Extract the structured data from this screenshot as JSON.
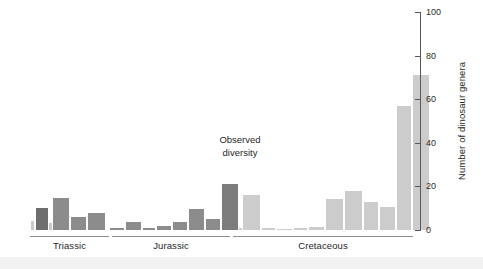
{
  "chart_data": {
    "type": "bar",
    "title": "",
    "subtitle": "",
    "xlabel": "",
    "ylabel": "Number of dinosaur genera",
    "ylim": [
      0,
      100
    ],
    "yticks": [
      0,
      20,
      40,
      60,
      80,
      100
    ],
    "ytick_labels": [
      "0",
      "20",
      "40",
      "60",
      "80",
      "100"
    ],
    "grid": false,
    "legend": false,
    "annotations": [
      {
        "text_line1": "Observed",
        "text_line2": "diversity",
        "x_px": 240,
        "y_px": 133
      }
    ],
    "x_axis_groups": [
      {
        "label": "Triassic",
        "start_px": 30,
        "end_px": 109
      },
      {
        "label": "Jurassic",
        "start_px": 112,
        "end_px": 230
      },
      {
        "label": "Cretaceous",
        "start_px": 233,
        "end_px": 413
      }
    ],
    "colors": {
      "triassic_dark": "#6e6e6e",
      "triassic_mid": "#8a8a8a",
      "jurassic": "#8a8a8a",
      "jurassic_dark": "#7a7a7a",
      "cretaceous": "#c8c8c8",
      "cretaceous_light": "#d2d2d2",
      "axis": "#585858",
      "text": "#1f1f1f",
      "background": "#ffffff"
    },
    "categories": [
      "T1",
      "T2",
      "T3",
      "T4",
      "T5",
      "T6",
      "J1",
      "J2",
      "J3",
      "J4",
      "J5",
      "J6",
      "J7",
      "J8",
      "J9",
      "J10",
      "K1",
      "K2",
      "K3",
      "K4",
      "K5",
      "K6",
      "K7",
      "K8",
      "K9",
      "K10",
      "K11"
    ],
    "values": [
      4,
      10,
      3,
      14.5,
      6,
      8,
      1,
      3.5,
      1,
      2,
      3.5,
      9.5,
      5,
      21,
      1,
      16,
      1,
      0.3,
      1,
      1.5,
      14,
      18,
      13,
      10.5,
      57,
      71,
      0
    ],
    "bars": [
      {
        "name": "T1",
        "x_px": 30.5,
        "w_px": 3,
        "value": 4,
        "color": "#c9c9c9"
      },
      {
        "name": "T2",
        "x_px": 36,
        "w_px": 12,
        "value": 10,
        "color": "#6e6e6e"
      },
      {
        "name": "T3",
        "x_px": 49,
        "w_px": 3,
        "value": 3,
        "color": "#c9c9c9"
      },
      {
        "name": "T4",
        "x_px": 53,
        "w_px": 16,
        "value": 14.5,
        "color": "#8c8c8c"
      },
      {
        "name": "T5",
        "x_px": 71,
        "w_px": 15,
        "value": 6,
        "color": "#8c8c8c"
      },
      {
        "name": "T6",
        "x_px": 88,
        "w_px": 17,
        "value": 8,
        "color": "#8c8c8c"
      },
      {
        "name": "J1",
        "x_px": 110,
        "w_px": 14,
        "value": 1,
        "color": "#8c8c8c"
      },
      {
        "name": "J2",
        "x_px": 126,
        "w_px": 15,
        "value": 3.5,
        "color": "#8c8c8c"
      },
      {
        "name": "J3",
        "x_px": 143,
        "w_px": 12,
        "value": 1,
        "color": "#8c8c8c"
      },
      {
        "name": "J4",
        "x_px": 157,
        "w_px": 14,
        "value": 2,
        "color": "#8c8c8c"
      },
      {
        "name": "J5",
        "x_px": 173,
        "w_px": 14,
        "value": 3.5,
        "color": "#8c8c8c"
      },
      {
        "name": "J6",
        "x_px": 189,
        "w_px": 15,
        "value": 9.5,
        "color": "#8c8c8c"
      },
      {
        "name": "J7",
        "x_px": 206,
        "w_px": 14,
        "value": 5,
        "color": "#8c8c8c"
      },
      {
        "name": "J8",
        "x_px": 222,
        "w_px": 16,
        "value": 21,
        "color": "#7d7d7d"
      },
      {
        "name": "J9",
        "x_px": 239,
        "w_px": 3,
        "value": 1,
        "color": "#c9c9c9"
      },
      {
        "name": "J10",
        "x_px": 243,
        "w_px": 17,
        "value": 16,
        "color": "#cccccc"
      },
      {
        "name": "K1",
        "x_px": 262,
        "w_px": 13,
        "value": 1,
        "color": "#cccccc"
      },
      {
        "name": "K2",
        "x_px": 277,
        "w_px": 15,
        "value": 0.3,
        "color": "#cccccc"
      },
      {
        "name": "K3",
        "x_px": 294,
        "w_px": 13,
        "value": 1,
        "color": "#cccccc"
      },
      {
        "name": "K4",
        "x_px": 309,
        "w_px": 15,
        "value": 1.5,
        "color": "#cccccc"
      },
      {
        "name": "K5",
        "x_px": 326,
        "w_px": 17,
        "value": 14,
        "color": "#cccccc"
      },
      {
        "name": "K6",
        "x_px": 345,
        "w_px": 17,
        "value": 18,
        "color": "#cccccc"
      },
      {
        "name": "K7",
        "x_px": 364,
        "w_px": 14,
        "value": 13,
        "color": "#cccccc"
      },
      {
        "name": "K8",
        "x_px": 380,
        "w_px": 15,
        "value": 10.5,
        "color": "#cccccc"
      },
      {
        "name": "K9",
        "x_px": 397,
        "w_px": 14,
        "value": 57,
        "color": "#cccccc"
      },
      {
        "name": "K10",
        "x_px": 413,
        "w_px": 16,
        "value": 71,
        "color": "#cccccc"
      }
    ]
  },
  "axis": {
    "ylabel": "Number of dinosaur genera",
    "ytick_labels": [
      "100",
      "80",
      "60",
      "40",
      "20",
      "0"
    ]
  },
  "periods": {
    "triassic": "Triassic",
    "jurassic": "Jurassic",
    "cretaceous": "Cretaceous"
  },
  "annotation": {
    "line1": "Observed",
    "line2": "diversity"
  }
}
